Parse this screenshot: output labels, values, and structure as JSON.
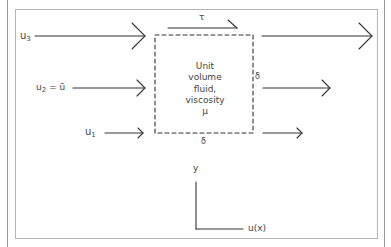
{
  "diagram": {
    "tau_label": "τ",
    "velocity_labels": {
      "u3": {
        "base": "u",
        "sub": "3"
      },
      "u2": {
        "base": "u",
        "sub": "2",
        "suffix": " = ū"
      },
      "u1": {
        "base": "u",
        "sub": "1"
      }
    },
    "box_text": [
      "Unit",
      "volume",
      "fluid,",
      "viscosity",
      "μ"
    ],
    "delta_right": "δ",
    "delta_bottom": "δ",
    "axis": {
      "y_label": "y",
      "x_label": "u(x)"
    },
    "colors": {
      "stroke": "#333333",
      "frame": "#b5b5b5",
      "text": "#444444"
    }
  }
}
